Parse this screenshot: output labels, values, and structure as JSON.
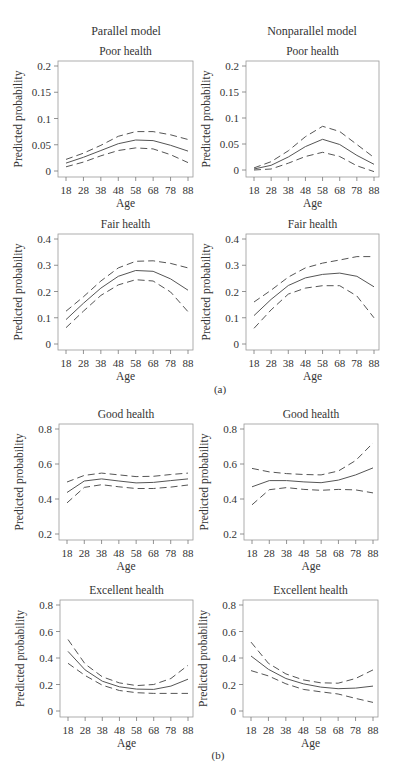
{
  "header": {
    "left_column_title": "Parallel model",
    "right_column_title": "Nonparallel model"
  },
  "subfigure_labels": {
    "a": "(a)",
    "b": "(b)"
  },
  "chart_data": [
    {
      "type": "line",
      "panel": "parallel-poor",
      "title": "Poor health",
      "xlabel": "Age",
      "ylabel": "Predicted probability",
      "x": [
        18,
        28,
        38,
        48,
        58,
        68,
        78,
        88
      ],
      "xticks": [
        18,
        28,
        38,
        48,
        58,
        68,
        78,
        88
      ],
      "ylim": [
        0,
        0.2
      ],
      "yticks": [
        0,
        0.05,
        0.1,
        0.15,
        0.2
      ],
      "ytick_labels": [
        "0",
        "0.05",
        "0.1",
        "0.15",
        "0.2"
      ],
      "series": [
        {
          "name": "upper CI",
          "style": "dashed",
          "values": [
            0.022,
            0.034,
            0.049,
            0.066,
            0.075,
            0.075,
            0.069,
            0.06
          ]
        },
        {
          "name": "estimate",
          "style": "solid",
          "values": [
            0.015,
            0.026,
            0.039,
            0.052,
            0.059,
            0.058,
            0.049,
            0.038
          ]
        },
        {
          "name": "lower CI",
          "style": "dashed",
          "values": [
            0.008,
            0.017,
            0.029,
            0.039,
            0.044,
            0.042,
            0.031,
            0.016
          ]
        }
      ]
    },
    {
      "type": "line",
      "panel": "nonparallel-poor",
      "title": "Poor health",
      "xlabel": "Age",
      "ylabel": "Predicted probability",
      "x": [
        18,
        28,
        38,
        48,
        58,
        68,
        78,
        88
      ],
      "xticks": [
        18,
        28,
        38,
        48,
        58,
        68,
        78,
        88
      ],
      "ylim": [
        0,
        0.2
      ],
      "yticks": [
        0,
        0.05,
        0.1,
        0.15,
        0.2
      ],
      "ytick_labels": [
        "0",
        "0.05",
        "0.1",
        "0.15",
        "0.2"
      ],
      "series": [
        {
          "name": "upper CI",
          "style": "dashed",
          "values": [
            0.004,
            0.016,
            0.037,
            0.064,
            0.084,
            0.074,
            0.049,
            0.024
          ]
        },
        {
          "name": "estimate",
          "style": "solid",
          "values": [
            0.002,
            0.009,
            0.025,
            0.045,
            0.059,
            0.049,
            0.028,
            0.011
          ]
        },
        {
          "name": "lower CI",
          "style": "dashed",
          "values": [
            0.0,
            0.002,
            0.013,
            0.026,
            0.034,
            0.026,
            0.008,
            -0.003
          ]
        }
      ]
    },
    {
      "type": "line",
      "panel": "parallel-fair",
      "title": "Fair health",
      "xlabel": "Age",
      "ylabel": "Predicted probability",
      "x": [
        18,
        28,
        38,
        48,
        58,
        68,
        78,
        88
      ],
      "xticks": [
        18,
        28,
        38,
        48,
        58,
        68,
        78,
        88
      ],
      "ylim": [
        0,
        0.4
      ],
      "yticks": [
        0,
        0.1,
        0.2,
        0.3,
        0.4
      ],
      "ytick_labels": [
        "0",
        "0.1",
        "0.2",
        "0.3",
        "0.4"
      ],
      "series": [
        {
          "name": "upper CI",
          "style": "dashed",
          "values": [
            0.125,
            0.18,
            0.24,
            0.29,
            0.315,
            0.317,
            0.307,
            0.29
          ]
        },
        {
          "name": "estimate",
          "style": "solid",
          "values": [
            0.093,
            0.155,
            0.213,
            0.258,
            0.28,
            0.277,
            0.248,
            0.205
          ]
        },
        {
          "name": "lower CI",
          "style": "dashed",
          "values": [
            0.062,
            0.125,
            0.185,
            0.225,
            0.245,
            0.24,
            0.198,
            0.123
          ]
        }
      ]
    },
    {
      "type": "line",
      "panel": "nonparallel-fair",
      "title": "Fair health",
      "xlabel": "Age",
      "ylabel": "Predicted probability",
      "x": [
        18,
        28,
        38,
        48,
        58,
        68,
        78,
        88
      ],
      "xticks": [
        18,
        28,
        38,
        48,
        58,
        68,
        78,
        88
      ],
      "ylim": [
        0,
        0.4
      ],
      "yticks": [
        0,
        0.1,
        0.2,
        0.3,
        0.4
      ],
      "ytick_labels": [
        "0",
        "0.1",
        "0.2",
        "0.3",
        "0.4"
      ],
      "series": [
        {
          "name": "upper CI",
          "style": "dashed",
          "values": [
            0.16,
            0.205,
            0.255,
            0.29,
            0.308,
            0.32,
            0.333,
            0.333
          ]
        },
        {
          "name": "estimate",
          "style": "solid",
          "values": [
            0.108,
            0.17,
            0.223,
            0.252,
            0.265,
            0.27,
            0.258,
            0.218
          ]
        },
        {
          "name": "lower CI",
          "style": "dashed",
          "values": [
            0.06,
            0.13,
            0.19,
            0.213,
            0.222,
            0.222,
            0.183,
            0.1
          ]
        }
      ]
    },
    {
      "type": "line",
      "panel": "parallel-good",
      "title": "Good health",
      "xlabel": "Age",
      "ylabel": "Predicted probability",
      "x": [
        18,
        28,
        38,
        48,
        58,
        68,
        78,
        88
      ],
      "xticks": [
        18,
        28,
        38,
        48,
        58,
        68,
        78,
        88
      ],
      "ylim": [
        0.2,
        0.8
      ],
      "yticks": [
        0.2,
        0.4,
        0.6,
        0.8
      ],
      "ytick_labels": [
        "0.2",
        "0.4",
        "0.6",
        "0.8"
      ],
      "series": [
        {
          "name": "upper CI",
          "style": "dashed",
          "values": [
            0.497,
            0.535,
            0.548,
            0.538,
            0.528,
            0.53,
            0.54,
            0.548
          ]
        },
        {
          "name": "estimate",
          "style": "solid",
          "values": [
            0.437,
            0.503,
            0.515,
            0.503,
            0.492,
            0.495,
            0.505,
            0.515
          ]
        },
        {
          "name": "lower CI",
          "style": "dashed",
          "values": [
            0.378,
            0.466,
            0.482,
            0.47,
            0.46,
            0.46,
            0.468,
            0.48
          ]
        }
      ]
    },
    {
      "type": "line",
      "panel": "nonparallel-good",
      "title": "Good health",
      "xlabel": "Age",
      "ylabel": "Predicted probability",
      "x": [
        18,
        28,
        38,
        48,
        58,
        68,
        78,
        88
      ],
      "xticks": [
        18,
        28,
        38,
        48,
        58,
        68,
        78,
        88
      ],
      "ylim": [
        0.2,
        0.8
      ],
      "yticks": [
        0.2,
        0.4,
        0.6,
        0.8
      ],
      "ytick_labels": [
        "0.2",
        "0.4",
        "0.6",
        "0.8"
      ],
      "series": [
        {
          "name": "upper CI",
          "style": "dashed",
          "values": [
            0.575,
            0.555,
            0.545,
            0.54,
            0.538,
            0.56,
            0.62,
            0.72
          ]
        },
        {
          "name": "estimate",
          "style": "solid",
          "values": [
            0.47,
            0.505,
            0.505,
            0.498,
            0.493,
            0.508,
            0.538,
            0.578
          ]
        },
        {
          "name": "lower CI",
          "style": "dashed",
          "values": [
            0.367,
            0.453,
            0.465,
            0.455,
            0.45,
            0.455,
            0.452,
            0.435
          ]
        }
      ]
    },
    {
      "type": "line",
      "panel": "parallel-excellent",
      "title": "Excellent health",
      "xlabel": "Age",
      "ylabel": "Predicted probability",
      "x": [
        18,
        28,
        38,
        48,
        58,
        68,
        78,
        88
      ],
      "xticks": [
        18,
        28,
        38,
        48,
        58,
        68,
        78,
        88
      ],
      "ylim": [
        0,
        0.8
      ],
      "yticks": [
        0,
        0.2,
        0.4,
        0.6,
        0.8
      ],
      "ytick_labels": [
        "0",
        "0.2",
        "0.4",
        "0.6",
        "0.8"
      ],
      "series": [
        {
          "name": "upper CI",
          "style": "dashed",
          "values": [
            0.54,
            0.355,
            0.258,
            0.212,
            0.192,
            0.2,
            0.245,
            0.345
          ]
        },
        {
          "name": "estimate",
          "style": "solid",
          "values": [
            0.45,
            0.31,
            0.225,
            0.183,
            0.165,
            0.163,
            0.188,
            0.24
          ]
        },
        {
          "name": "lower CI",
          "style": "dashed",
          "values": [
            0.36,
            0.268,
            0.195,
            0.155,
            0.138,
            0.133,
            0.133,
            0.133
          ]
        }
      ]
    },
    {
      "type": "line",
      "panel": "nonparallel-excellent",
      "title": "Excellent health",
      "xlabel": "Age",
      "ylabel": "Predicted probability",
      "x": [
        18,
        28,
        38,
        48,
        58,
        68,
        78,
        88
      ],
      "xticks": [
        18,
        28,
        38,
        48,
        58,
        68,
        78,
        88
      ],
      "ylim": [
        0,
        0.8
      ],
      "yticks": [
        0,
        0.2,
        0.4,
        0.6,
        0.8
      ],
      "ytick_labels": [
        "0",
        "0.2",
        "0.4",
        "0.6",
        "0.8"
      ],
      "series": [
        {
          "name": "upper CI",
          "style": "dashed",
          "values": [
            0.52,
            0.36,
            0.28,
            0.235,
            0.213,
            0.21,
            0.245,
            0.31
          ]
        },
        {
          "name": "estimate",
          "style": "solid",
          "values": [
            0.415,
            0.315,
            0.245,
            0.205,
            0.18,
            0.168,
            0.173,
            0.188
          ]
        },
        {
          "name": "lower CI",
          "style": "dashed",
          "values": [
            0.305,
            0.265,
            0.205,
            0.163,
            0.145,
            0.128,
            0.095,
            0.065
          ]
        }
      ]
    }
  ],
  "layout": {
    "panels": [
      {
        "frame": [
          58,
          61,
          193,
          177
        ],
        "yrange_px": [
          171,
          66
        ]
      },
      {
        "frame": [
          246,
          61,
          379,
          177
        ],
        "yrange_px": [
          170,
          66
        ]
      },
      {
        "frame": [
          58,
          234,
          193,
          350
        ],
        "yrange_px": [
          344,
          239
        ]
      },
      {
        "frame": [
          246,
          234,
          379,
          350
        ],
        "yrange_px": [
          344,
          239
        ]
      },
      {
        "frame": [
          59,
          424,
          193,
          540
        ],
        "yrange_px": [
          534,
          429
        ]
      },
      {
        "frame": [
          244,
          424,
          378,
          540
        ],
        "yrange_px": [
          534,
          429
        ]
      },
      {
        "frame": [
          60,
          600,
          193,
          717
        ],
        "yrange_px": [
          711,
          605
        ]
      },
      {
        "frame": [
          243,
          600,
          378,
          717
        ],
        "yrange_px": [
          711,
          605
        ]
      }
    ]
  }
}
